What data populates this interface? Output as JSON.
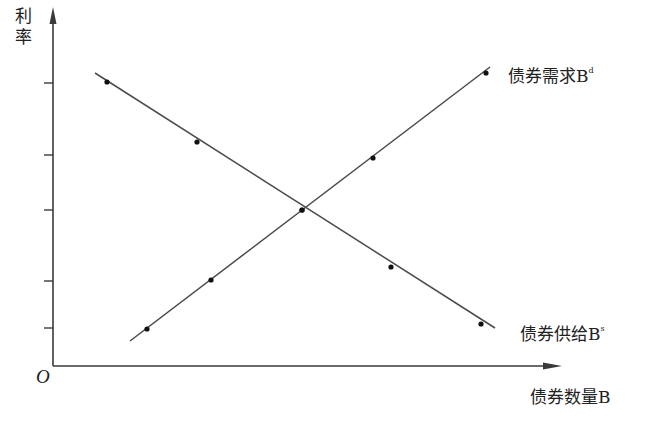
{
  "chart_data": {
    "type": "line",
    "title": "",
    "xlabel": "债券数量B",
    "ylabel": "利率",
    "origin_label": "O",
    "grid": false,
    "legend": "inline labels at line ends",
    "y_ticks_px": [
      83,
      155,
      210,
      281,
      328
    ],
    "y_tick_labels": [],
    "x_tick_labels": [],
    "series": [
      {
        "name": "债券需求B",
        "superscript": "d",
        "slope": "upward",
        "line_px": [
          [
            130,
            341
          ],
          [
            490,
            67
          ]
        ],
        "points_px": [
          [
            147,
            329
          ],
          [
            211,
            280
          ],
          [
            302,
            210
          ],
          [
            373,
            158
          ],
          [
            486,
            73
          ]
        ]
      },
      {
        "name": "债券供给B",
        "superscript": "s",
        "slope": "downward",
        "line_px": [
          [
            95,
            73
          ],
          [
            495,
            328
          ]
        ],
        "points_px": [
          [
            107,
            82
          ],
          [
            197,
            142
          ],
          [
            302,
            210
          ],
          [
            391,
            267
          ],
          [
            481,
            324
          ]
        ]
      }
    ],
    "equilibrium_px": [
      302,
      210
    ]
  },
  "labels": {
    "y_axis_line1": "利",
    "y_axis_line2": "率",
    "origin": "O",
    "x_axis": "债券数量B",
    "demand_curve": "债券需求B",
    "demand_sup": "d",
    "supply_curve": "债券供给B",
    "supply_sup": "s"
  },
  "colors": {
    "axis": "#3a3a3a",
    "line": "#4a4a4a",
    "point": "#111111",
    "text": "#222222"
  }
}
